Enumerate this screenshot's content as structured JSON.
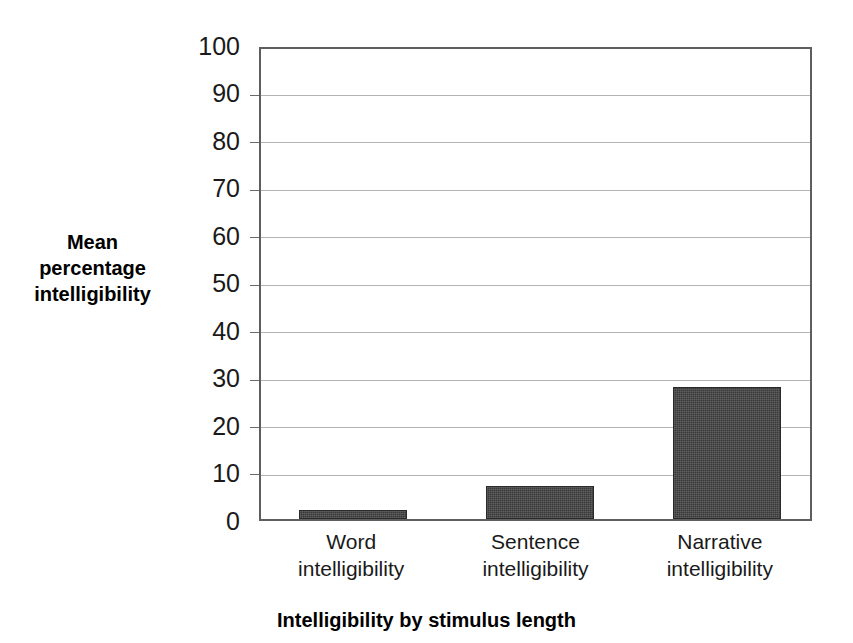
{
  "chart_data": {
    "type": "bar",
    "title": "",
    "xlabel": "Intelligibility by stimulus length",
    "ylabel": "Mean percentage intelligibility",
    "categories": [
      "Word intelligibility",
      "Sentence intelligibility",
      "Narrative intelligibility"
    ],
    "category_lines": [
      [
        "Word",
        "intelligibility"
      ],
      [
        "Sentence",
        "intelligibility"
      ],
      [
        "Narrative",
        "intelligibility"
      ]
    ],
    "values": [
      2,
      7,
      28
    ],
    "ylim": [
      0,
      100
    ],
    "ytick_labels": [
      "100",
      "90",
      "80",
      "70",
      "60",
      "50",
      "40",
      "30",
      "20",
      "10",
      "0"
    ],
    "ytick_values": [
      100,
      90,
      80,
      70,
      60,
      50,
      40,
      30,
      20,
      10,
      0
    ],
    "ytick_step": 10,
    "grid": true,
    "legend": false,
    "bar_color": "#3a3a3a",
    "gridline_color": "#b4b4b4",
    "axis_color": "#5e5e5e",
    "background_color": "#ffffff"
  },
  "axis_titles": {
    "y_lines": [
      "Mean",
      "percentage",
      "intelligibility"
    ],
    "x": "Intelligibility by stimulus length"
  }
}
